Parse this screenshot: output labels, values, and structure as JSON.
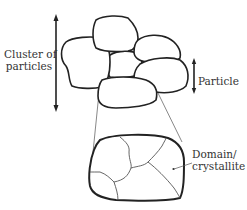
{
  "diagram": {
    "type": "schematic",
    "labels": {
      "cluster_line1": "Cluster of",
      "cluster_line2": "particles",
      "particle": "Particle",
      "domain_line1": "Domain/",
      "domain_line2": "crystallite"
    },
    "elements": [
      {
        "id": "cluster",
        "description": "group of 7 irregular rounded particles"
      },
      {
        "id": "cluster-arrow",
        "description": "double-headed vertical arrow spanning the cluster"
      },
      {
        "id": "particle-arrow",
        "description": "double-headed vertical arrow spanning one particle"
      },
      {
        "id": "magnified-particle",
        "description": "enlarged bottom particle showing internal grain boundaries"
      },
      {
        "id": "domain-pointer",
        "description": "leader line pointing to one domain inside magnified particle"
      }
    ],
    "colors": {
      "stroke": "#222222",
      "grain": "#555555",
      "background": "#ffffff"
    }
  }
}
